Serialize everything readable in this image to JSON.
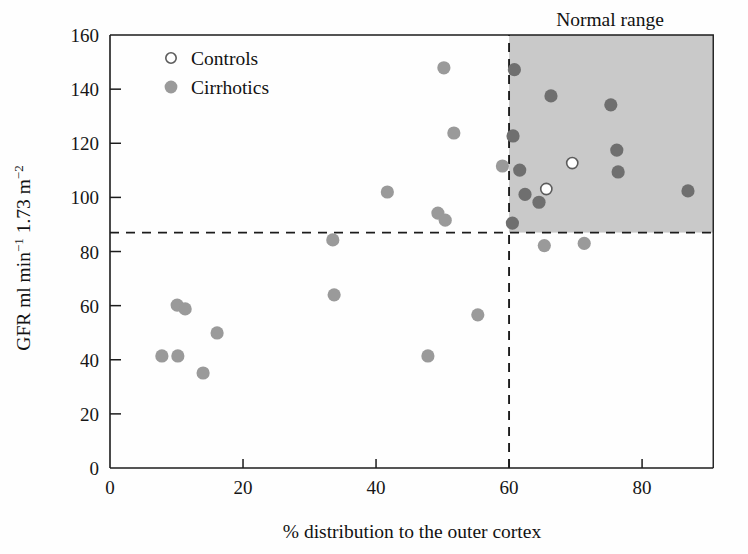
{
  "chart_data": {
    "type": "scatter",
    "title": "",
    "xlabel": "% distribution to the outer cortex",
    "ylabel": "GFR ml min⁻¹ 1.73 m⁻²",
    "ylabel_parts": {
      "base1": "GFR ml min",
      "sup1": "−1",
      "base2": " 1.73 m",
      "sup2": "−2"
    },
    "xlim": [
      0,
      90.7
    ],
    "ylim": [
      0,
      160
    ],
    "xticks": [
      0,
      20,
      40,
      60,
      80
    ],
    "xticklabels": [
      "0",
      "20",
      "40",
      "60",
      "80"
    ],
    "yticks": [
      0,
      20,
      40,
      60,
      80,
      100,
      120,
      140,
      160
    ],
    "yticklabels": [
      "0",
      "20",
      "40",
      "60",
      "80",
      "100",
      "120",
      "140",
      "160"
    ],
    "grid": false,
    "legend_position": "top-left-inside",
    "legend": [
      {
        "label": "Controls",
        "marker": "open-circle",
        "color": "#ffffff",
        "edge": "#5c5c5c"
      },
      {
        "label": "Cirrhotics",
        "marker": "filled-circle",
        "color": "#9a9a9a",
        "edge": "none"
      }
    ],
    "annotations": [
      {
        "text": "Normal range",
        "x": 75,
        "y": 168,
        "role": "shaded-region-title"
      }
    ],
    "shaded_region": {
      "label": "Normal range",
      "x_min": 60,
      "x_max": 90.7,
      "y_min": 87,
      "y_max": 160,
      "color": "#c9c9c9"
    },
    "reference_lines": [
      {
        "orientation": "horizontal",
        "value": 87,
        "style": "dashed",
        "label": ""
      },
      {
        "orientation": "vertical",
        "value": 60,
        "style": "dashed",
        "label": ""
      }
    ],
    "series": [
      {
        "name": "Controls",
        "marker": "open-circle",
        "points": [
          {
            "x": 69.5,
            "y": 112.7
          },
          {
            "x": 65.6,
            "y": 103.1
          }
        ]
      },
      {
        "name": "Cirrhotics",
        "marker": "filled-circle",
        "points": [
          {
            "x": 7.8,
            "y": 41.4
          },
          {
            "x": 10.2,
            "y": 41.4
          },
          {
            "x": 10.1,
            "y": 60.2
          },
          {
            "x": 11.3,
            "y": 58.8
          },
          {
            "x": 14.0,
            "y": 35.1
          },
          {
            "x": 16.1,
            "y": 49.9
          },
          {
            "x": 33.7,
            "y": 64.0
          },
          {
            "x": 33.5,
            "y": 84.3
          },
          {
            "x": 41.7,
            "y": 102.0
          },
          {
            "x": 47.8,
            "y": 41.4
          },
          {
            "x": 50.2,
            "y": 147.9
          },
          {
            "x": 49.3,
            "y": 94.2
          },
          {
            "x": 50.4,
            "y": 91.6
          },
          {
            "x": 51.7,
            "y": 123.8
          },
          {
            "x": 55.3,
            "y": 56.6
          },
          {
            "x": 59.0,
            "y": 111.6
          },
          {
            "x": 60.5,
            "y": 90.5
          },
          {
            "x": 60.8,
            "y": 147.2
          },
          {
            "x": 60.6,
            "y": 122.7
          },
          {
            "x": 61.6,
            "y": 110.1
          },
          {
            "x": 62.4,
            "y": 101.1
          },
          {
            "x": 64.5,
            "y": 98.2
          },
          {
            "x": 65.3,
            "y": 82.2
          },
          {
            "x": 66.3,
            "y": 137.5
          },
          {
            "x": 71.3,
            "y": 83.0
          },
          {
            "x": 75.3,
            "y": 134.2
          },
          {
            "x": 76.2,
            "y": 117.5
          },
          {
            "x": 76.4,
            "y": 109.4
          },
          {
            "x": 86.9,
            "y": 102.4
          }
        ]
      }
    ]
  },
  "axes": {
    "x_title": "% distribution to the outer cortex",
    "y_title_base1": "GFR ml min",
    "y_title_sup1": "−1",
    "y_title_base2": " 1.73 m",
    "y_title_sup2": "−2"
  },
  "labels": {
    "normal_range": "Normal range",
    "controls": "Controls",
    "cirrhotics": "Cirrhotics"
  },
  "colors": {
    "cirrhotic_marker": "#9a9a9a",
    "cirrhotic_marker_dark": "#6f6f6f",
    "control_marker_fill": "#ffffff",
    "control_marker_edge": "#5c5c5c",
    "shaded_region": "#c9c9c9",
    "axis": "#1c1c1c",
    "text": "#121212"
  }
}
